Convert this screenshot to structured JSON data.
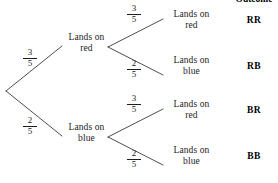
{
  "diagram": {
    "type": "probability-tree",
    "columns": {
      "outcome_header": "Outcome"
    },
    "root": {
      "branches": [
        {
          "probability": "3/5",
          "numerator": "3",
          "denominator": "5",
          "label_line1": "Lands on",
          "label_line2": "red",
          "children": [
            {
              "probability": "3/5",
              "numerator": "3",
              "denominator": "5",
              "label_line1": "Lands on",
              "label_line2": "red",
              "outcome": "RR"
            },
            {
              "probability": "2/5",
              "numerator": "2",
              "denominator": "5",
              "label_line1": "Lands on",
              "label_line2": "blue",
              "outcome": "RB"
            }
          ]
        },
        {
          "probability": "2/5",
          "numerator": "2",
          "denominator": "5",
          "label_line1": "Lands on",
          "label_line2": "blue",
          "children": [
            {
              "probability": "3/5",
              "numerator": "3",
              "denominator": "5",
              "label_line1": "Lands on",
              "label_line2": "red",
              "outcome": "BR"
            },
            {
              "probability": "2/5",
              "numerator": "2",
              "denominator": "5",
              "label_line1": "Lands on",
              "label_line2": "blue",
              "outcome": "BB"
            }
          ]
        }
      ]
    },
    "colors": {
      "line": "#3a3a3a",
      "text": "#1d1d1d",
      "background": "#ffffff"
    }
  }
}
